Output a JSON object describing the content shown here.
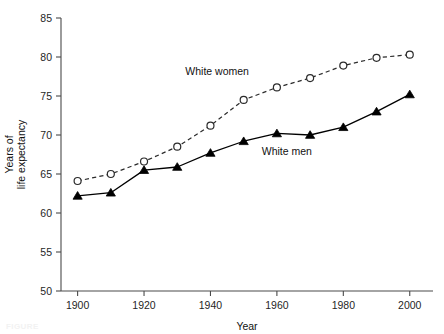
{
  "chart_data": {
    "type": "line",
    "title": "",
    "xlabel": "Year",
    "ylabel": "Years of life expectancy",
    "ylabel_line1": "Years of",
    "ylabel_line2": "life expectancy",
    "x": [
      1900,
      1910,
      1920,
      1930,
      1940,
      1950,
      1960,
      1970,
      1980,
      1990,
      2000
    ],
    "xlim": [
      1895,
      2007
    ],
    "ylim": [
      50,
      85
    ],
    "xticks": [
      1900,
      1920,
      1940,
      1960,
      1980,
      2000
    ],
    "xtick_labels": [
      "1900",
      "1920",
      "1940",
      "1960",
      "1980",
      "2000"
    ],
    "yticks": [
      50,
      55,
      60,
      65,
      70,
      75,
      80,
      85
    ],
    "ytick_labels": [
      "50",
      "55",
      "60",
      "65",
      "70",
      "75",
      "80",
      "85"
    ],
    "grid": false,
    "legend_position": "inline-annotation",
    "series": [
      {
        "name": "White women",
        "marker": "open-circle",
        "linestyle": "dashed",
        "color": "#2b2b2b",
        "x": [
          1900,
          1910,
          1920,
          1930,
          1940,
          1950,
          1960,
          1970,
          1980,
          1990,
          2000
        ],
        "values": [
          64.1,
          65.0,
          66.6,
          68.5,
          71.2,
          74.5,
          76.1,
          77.3,
          78.9,
          79.9,
          80.3
        ]
      },
      {
        "name": "White men",
        "marker": "filled-triangle",
        "linestyle": "solid",
        "color": "#000000",
        "x": [
          1900,
          1910,
          1920,
          1930,
          1940,
          1950,
          1960,
          1970,
          1980,
          1990,
          2000
        ],
        "values": [
          62.2,
          62.6,
          65.5,
          65.9,
          67.7,
          69.2,
          70.2,
          70.0,
          71.0,
          73.0,
          75.2
        ]
      }
    ],
    "annotations": [
      {
        "text": "White women",
        "x": 1942,
        "y": 77.7
      },
      {
        "text": "White men",
        "x": 1963,
        "y": 67.4
      }
    ]
  },
  "figure": {
    "caption_fragment": "FIGURE"
  }
}
